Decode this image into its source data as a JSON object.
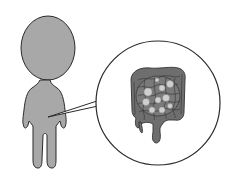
{
  "figure": {
    "title": "Human body with magnified view of intestines",
    "callout_subject": "intestines",
    "colors": {
      "background": "#ffffff",
      "body_fill": "#a8a8a8",
      "outline": "#2a2a2a",
      "intestine_fill": "#6e6e6e",
      "intestine_lines": "#333333",
      "bubble_fill": "#cfcfcf",
      "callout_fill": "#ffffff"
    }
  }
}
